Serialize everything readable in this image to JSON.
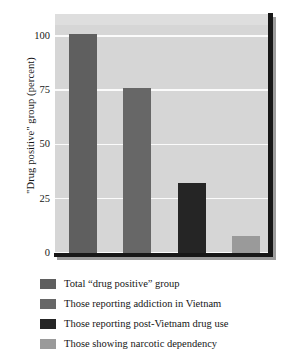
{
  "chart_data": {
    "type": "bar",
    "title": "",
    "xlabel": "",
    "ylabel": "\"Drug positive\" group (percent)",
    "ylim": [
      0,
      110
    ],
    "yticks": [
      0,
      25,
      50,
      75,
      100
    ],
    "ytick_labels": [
      "0",
      "25",
      "50",
      "75",
      "100"
    ],
    "grid": true,
    "legend_position": "below",
    "categories": [
      "Total “drug positive” group",
      "Those reporting addiction in Vietnam",
      "Those reporting post-Vietnam drug use",
      "Those showing narcotic dependency"
    ],
    "values": [
      101,
      76,
      32,
      8
    ],
    "colors": [
      "#5f5f5f",
      "#676767",
      "#252525",
      "#9a9a9a"
    ],
    "background": "#d6d6d6",
    "gridline_color": "#fbfbfb",
    "axis_color": "#171717"
  },
  "legend": {
    "items": [
      {
        "label": "Total “drug positive” group",
        "color": "#5f5f5f"
      },
      {
        "label": "Those reporting addiction in Vietnam",
        "color": "#676767"
      },
      {
        "label": "Those reporting post-Vietnam drug use",
        "color": "#252525"
      },
      {
        "label": "Those showing narcotic dependency",
        "color": "#9a9a9a"
      }
    ]
  }
}
